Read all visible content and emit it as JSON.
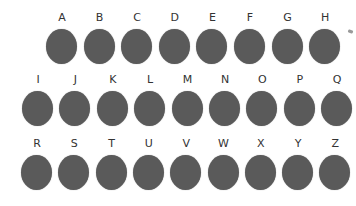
{
  "style": {
    "dot_color": "#5a5a5a",
    "label_color": "#333333"
  },
  "rows": [
    {
      "letters": [
        "A",
        "B",
        "C",
        "D",
        "E",
        "F",
        "G",
        "H"
      ],
      "x0": 46,
      "step": 37.6,
      "y": 12
    },
    {
      "letters": [
        "I",
        "J",
        "K",
        "L",
        "M",
        "N",
        "O",
        "P",
        "Q"
      ],
      "x0": 22,
      "step": 37.4,
      "y": 74
    },
    {
      "letters": [
        "R",
        "S",
        "T",
        "U",
        "V",
        "W",
        "X",
        "Y",
        "Z"
      ],
      "x0": 21,
      "step": 37.3,
      "y": 138
    }
  ]
}
